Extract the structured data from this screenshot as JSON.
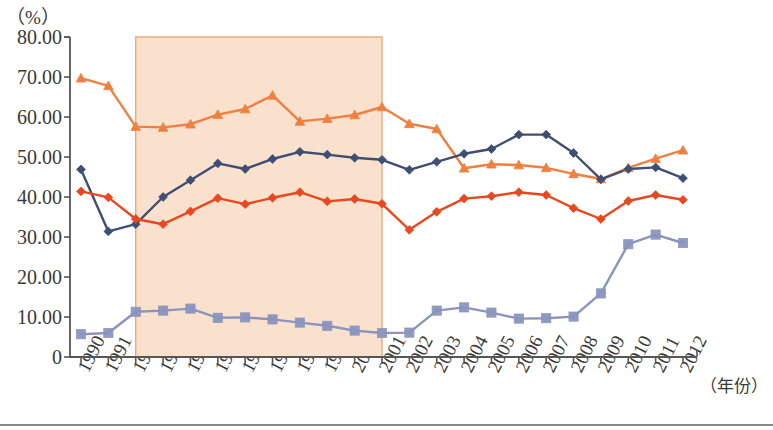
{
  "chart_data": {
    "type": "line",
    "title": "",
    "ylabel": "（%）",
    "xlabel": "（年份）",
    "ylim": [
      0,
      80
    ],
    "ytick_labels": [
      "0",
      "10.00",
      "20.00",
      "30.00",
      "40.00",
      "50.00",
      "60.00",
      "70.00",
      "80.00"
    ],
    "ytick_values": [
      0,
      10,
      20,
      30,
      40,
      50,
      60,
      70,
      80
    ],
    "grid": false,
    "legend": "none",
    "categories": [
      "1990",
      "1991",
      "1992",
      "1993",
      "1994",
      "1995",
      "1996",
      "1997",
      "1998",
      "1999",
      "2000",
      "2001",
      "2002",
      "2003",
      "2004",
      "2005",
      "2006",
      "2007",
      "2008",
      "2009",
      "2010",
      "2011",
      "2012"
    ],
    "series": [
      {
        "name": "series-light-orange",
        "color": "#ef8040",
        "marker": "triangle",
        "values": [
          69.7,
          67.8,
          57.6,
          57.4,
          58.2,
          60.6,
          62.0,
          65.4,
          58.9,
          59.6,
          60.5,
          62.5,
          58.3,
          57.0,
          47.2,
          48.2,
          48.0,
          47.3,
          45.8,
          44.5,
          47.3,
          49.6,
          51.7
        ]
      },
      {
        "name": "series-navy",
        "color": "#3e4f73",
        "marker": "diamond",
        "values": [
          46.9,
          31.4,
          33.2,
          40.0,
          44.2,
          48.4,
          47.0,
          49.5,
          51.3,
          50.6,
          49.8,
          49.3,
          46.8,
          48.8,
          50.8,
          52.0,
          55.6,
          55.6,
          51.0,
          44.4,
          47.0,
          47.4,
          44.7
        ]
      },
      {
        "name": "series-red-orange",
        "color": "#e8481f",
        "marker": "diamond",
        "values": [
          41.4,
          39.9,
          34.5,
          33.2,
          36.4,
          39.7,
          38.2,
          39.8,
          41.2,
          38.9,
          39.5,
          38.3,
          31.8,
          36.3,
          39.6,
          40.2,
          41.2,
          40.5,
          37.2,
          34.5,
          39.0,
          40.5,
          39.3
        ]
      },
      {
        "name": "series-gray-purple",
        "color": "#8b94bd",
        "marker": "square",
        "values": [
          5.7,
          6.0,
          11.3,
          11.6,
          12.1,
          9.8,
          9.9,
          9.4,
          8.6,
          7.8,
          6.6,
          6.0,
          6.1,
          11.6,
          12.4,
          11.1,
          9.6,
          9.7,
          10.1,
          15.9,
          28.2,
          30.6,
          28.5
        ]
      }
    ],
    "shaded_region": {
      "name": "highlight-band",
      "from_category": "1992",
      "to_category": "2001",
      "fill": "#fae1cd",
      "stroke": "#f0a878",
      "y_top": 80
    }
  }
}
